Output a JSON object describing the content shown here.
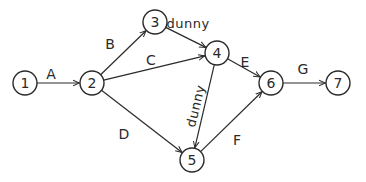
{
  "diagram": {
    "type": "activity-on-arrow network",
    "nodes": [
      {
        "id": "1",
        "label": "1",
        "x": 25,
        "y": 83
      },
      {
        "id": "2",
        "label": "2",
        "x": 92,
        "y": 83
      },
      {
        "id": "3",
        "label": "3",
        "x": 155,
        "y": 22
      },
      {
        "id": "4",
        "label": "4",
        "x": 217,
        "y": 53
      },
      {
        "id": "5",
        "label": "5",
        "x": 192,
        "y": 160
      },
      {
        "id": "6",
        "label": "6",
        "x": 271,
        "y": 83
      },
      {
        "id": "7",
        "label": "7",
        "x": 338,
        "y": 83
      }
    ],
    "edges": [
      {
        "from": "1",
        "to": "2",
        "label": "A",
        "lx": 51,
        "ly": 79
      },
      {
        "from": "2",
        "to": "3",
        "label": "B",
        "lx": 110,
        "ly": 49
      },
      {
        "from": "2",
        "to": "4",
        "label": "C",
        "lx": 151,
        "ly": 65
      },
      {
        "from": "2",
        "to": "5",
        "label": "D",
        "lx": 124,
        "ly": 139
      },
      {
        "from": "3",
        "to": "4",
        "label": "dunny",
        "lx": 188,
        "ly": 28,
        "dummy": true
      },
      {
        "from": "4",
        "to": "6",
        "label": "E",
        "lx": 245,
        "ly": 67
      },
      {
        "from": "4",
        "to": "5",
        "label": "dunny",
        "lx": 200,
        "ly": 107,
        "dummy": true,
        "rotate": -76
      },
      {
        "from": "5",
        "to": "6",
        "label": "F",
        "lx": 237,
        "ly": 145
      },
      {
        "from": "6",
        "to": "7",
        "label": "G",
        "lx": 303,
        "ly": 74
      }
    ]
  }
}
